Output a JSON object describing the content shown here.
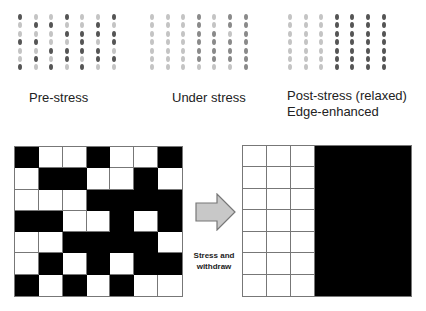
{
  "top_panels": [
    {
      "id": "pre-stress",
      "label_lines": [
        "Pre-stress"
      ],
      "origin_x": 20,
      "label_x": 29,
      "label_y": 90,
      "pattern": [
        "DLLDLLD",
        "LDDLLDL",
        "LLLDDDD",
        "DDLLDLD",
        "LLDDDDL",
        "LDLDLDD",
        "DLDLDLL"
      ]
    },
    {
      "id": "under-stress",
      "label_lines": [
        "Under stress"
      ],
      "origin_x": 152,
      "label_x": 172,
      "label_y": 90,
      "pattern": [
        "LLLMLMM",
        "LLLMLMM",
        "LLLMMLM",
        "LLLMMMM",
        "LLLMMMM",
        "LLLMMMM",
        "LLLLLLM"
      ]
    },
    {
      "id": "post-stress",
      "label_lines": [
        "Post-stress (relaxed)",
        "Edge-enhanced"
      ],
      "origin_x": 290,
      "label_x": 287,
      "label_y": 88,
      "pattern": [
        "LLLDDDD",
        "LLLDDDD",
        "LLLDDDD",
        "LLLDDDD",
        "LLLDDDD",
        "LLLDDDD",
        "LLLDDDD"
      ]
    }
  ],
  "dot_colors": {
    "D": "#555555",
    "M": "#8a8a8a",
    "L": "#c4c4c4"
  },
  "dot_spacing": {
    "x": 15.6,
    "y": 8.4,
    "top": 17
  },
  "left_grid": {
    "x": 14,
    "y": 146,
    "width": 169,
    "height": 151,
    "cells": [
      "BWWBWWB",
      "WBBWWBW",
      "WWWBBBB",
      "BBWWBWB",
      "WWBBBBW",
      "WBWBWBB",
      "BWBWBWW"
    ]
  },
  "right_grid": {
    "x": 242,
    "y": 145,
    "width": 170,
    "height": 152,
    "cells": [
      "WWWBBBB",
      "WWWBBBB",
      "WWWBBBB",
      "WWWBBBB",
      "WWWBBBB",
      "WWWBBBB",
      "WWWBBBB"
    ]
  },
  "arrow": {
    "fill": "#c8c8c8",
    "stroke": "#777777",
    "caption_line1": "Stress and",
    "caption_line2": "withdraw"
  }
}
